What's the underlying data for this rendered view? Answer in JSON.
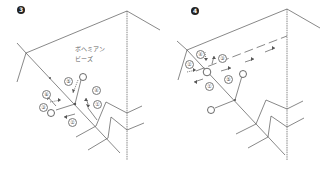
{
  "panels": [
    {
      "step": "3",
      "label_bead": "ボヘミアン",
      "label_bead2": "ビーズ",
      "numbers": [
        "①",
        "②",
        "③",
        "④",
        "⑤",
        "⑥"
      ]
    },
    {
      "step": "4",
      "numbers": [
        "①",
        "②",
        "③",
        "④",
        "⑤"
      ]
    }
  ],
  "colors": {
    "line": "#555555",
    "badge": "#222222",
    "background": "#ffffff"
  }
}
